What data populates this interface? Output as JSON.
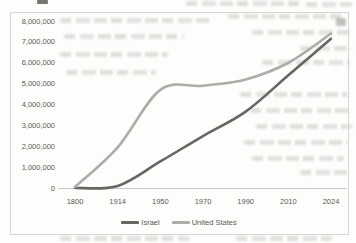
{
  "chart_data": {
    "type": "line",
    "title": "",
    "smoothed": true,
    "gridlines": false,
    "legend_position": "bottom",
    "categories": [
      "1800",
      "1914",
      "1950",
      "1970",
      "1990",
      "2010",
      "2024"
    ],
    "series": [
      {
        "name": "Israel",
        "color": "#666663",
        "values": [
          0,
          100000,
          1270000,
          2490000,
          3660000,
          5400000,
          7150000
        ]
      },
      {
        "name": "United States",
        "color": "#aeaca8",
        "values": [
          50000,
          1950000,
          4700000,
          4900000,
          5200000,
          6000000,
          7400000
        ]
      }
    ],
    "xlabel": "",
    "ylabel": "",
    "ylim": [
      0,
      8000000
    ],
    "y_ticks": [
      "8,000,000",
      "7,000,000",
      "6,000,000",
      "5,000,000",
      "4,000,000",
      "3,000,000",
      "2,000,000",
      "1,000,000",
      "0"
    ]
  },
  "axis_colors": {
    "tick_text": "#595959",
    "axis_line": "#c7c6c3",
    "frame_border": "#d6d5d2"
  }
}
